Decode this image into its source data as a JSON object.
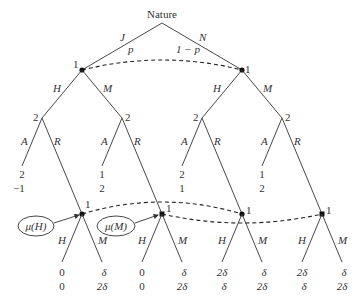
{
  "root": {
    "label": "Nature"
  },
  "nature_moves": [
    {
      "action": "J",
      "prob": "p"
    },
    {
      "action": "N",
      "prob": "1 − p"
    }
  ],
  "player_labels": {
    "p1": "1",
    "p2": "2"
  },
  "actions": {
    "H": "H",
    "M": "M",
    "A": "A",
    "R": "R"
  },
  "beliefs": [
    {
      "label": "μ(H)"
    },
    {
      "label": "μ(M)"
    }
  ],
  "accept_payoffs": [
    {
      "p1": "2",
      "p2": "−1"
    },
    {
      "p1": "1",
      "p2": "2"
    },
    {
      "p1": "2",
      "p2": "1"
    },
    {
      "p1": "1",
      "p2": "2"
    }
  ],
  "terminal_payoffs": [
    {
      "p1": "0",
      "p2": "0"
    },
    {
      "p1": "δ",
      "p2": "2δ"
    },
    {
      "p1": "0",
      "p2": "0"
    },
    {
      "p1": "δ",
      "p2": "2δ"
    },
    {
      "p1": "2δ",
      "p2": "δ"
    },
    {
      "p1": "δ",
      "p2": "2δ"
    },
    {
      "p1": "2δ",
      "p2": "δ"
    },
    {
      "p1": "δ",
      "p2": "2δ"
    }
  ]
}
